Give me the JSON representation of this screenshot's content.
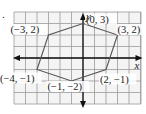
{
  "problem_marker": ".",
  "chart_data": {
    "type": "scatter",
    "title": "",
    "xlabel": "x",
    "ylabel": "y",
    "xlim": [
      -6,
      5
    ],
    "ylim": [
      -4,
      4
    ],
    "grid": true,
    "polygon": true,
    "points": [
      {
        "x": 0,
        "y": 3,
        "label": "(0, 3)"
      },
      {
        "x": 3,
        "y": 2,
        "label": "(3, 2)"
      },
      {
        "x": 2,
        "y": -1,
        "label": "(2, −1)"
      },
      {
        "x": -1,
        "y": -2,
        "label": "(−1, −2)"
      },
      {
        "x": -4,
        "y": -1,
        "label": "(−4, −1)"
      },
      {
        "x": -3,
        "y": 2,
        "label": "(−3, 2)"
      }
    ],
    "colors": {
      "grid": "#9a9a9a",
      "axis": "#111111",
      "polygon": "#555555",
      "background": "#f4f4f4"
    }
  }
}
